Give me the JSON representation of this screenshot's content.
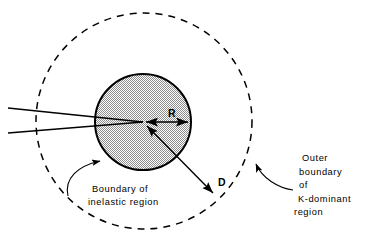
{
  "figure": {
    "background_color": "#ffffff",
    "line_color": "#000000",
    "fill_pattern": "stipple-dot",
    "fill_color": "#9a9a9a"
  },
  "shapes": {
    "outer_circle": {
      "name": "K-dominant region boundary",
      "style": "dashed",
      "center_x": 144,
      "center_y": 121,
      "radius": 108,
      "dash": "7,6"
    },
    "inner_circle": {
      "name": "Inelastic region boundary",
      "style": "solid",
      "center_x": 143,
      "center_y": 122,
      "radius": 48,
      "fill": "stippled"
    },
    "crack": {
      "name": "crack-wedge",
      "tip_x": 143,
      "tip_y": 122,
      "upper_start_x": 8,
      "upper_start_y": 108,
      "lower_start_x": 8,
      "lower_start_y": 133
    }
  },
  "dimensions": {
    "radius_arrow": {
      "label": "R",
      "label_x": 172,
      "label_y": 117,
      "from_x": 143,
      "from_y": 122,
      "to_x": 191,
      "to_y": 122
    },
    "diameter_arrow": {
      "label": "D",
      "label_x": 222,
      "label_y": 182,
      "from_x": 143,
      "from_y": 122,
      "to_x": 217,
      "to_y": 197
    }
  },
  "annotations": {
    "inelastic": {
      "name": "inelastic-region-callout",
      "lines": [
        "Boundary of",
        "inelastic region"
      ],
      "text_x": 92,
      "text_y_start": 192,
      "line_height": 13,
      "arrow_tip_x": 104,
      "arrow_tip_y": 162
    },
    "outer": {
      "name": "k-dominant-region-callout",
      "lines": [
        "Outer",
        "boundary",
        "of",
        "K-dominant",
        "region"
      ],
      "text_x": 296,
      "text_y_start": 161,
      "line_height": 13.5,
      "arrow_tip_x": 255,
      "arrow_tip_y": 161
    }
  }
}
